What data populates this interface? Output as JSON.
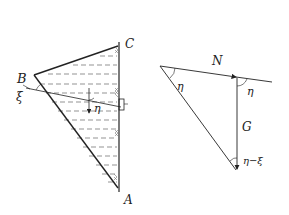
{
  "figure_left": {
    "title": "Dam / wedge cross-section",
    "labels": {
      "B": "B",
      "C": "C",
      "A": "A",
      "xi": "ξ",
      "eta": "η"
    }
  },
  "figure_right": {
    "title": "Force triangle",
    "labels": {
      "N": "N",
      "G": "G",
      "eta_top": "η",
      "eta_right": "η",
      "eta_minus_xi": "η−ξ"
    }
  },
  "colors": {
    "line": "#222222",
    "hatch": "#555555",
    "background": "#ffffff"
  }
}
